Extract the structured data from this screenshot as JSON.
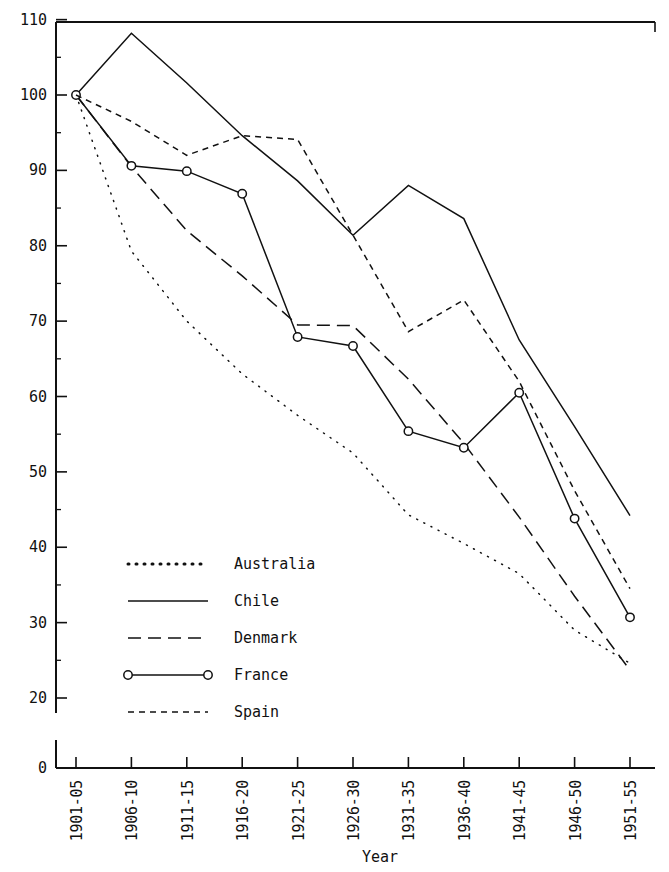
{
  "chart_data": {
    "type": "line",
    "title": "",
    "xlabel": "Year",
    "ylabel": "",
    "categories": [
      "1901-05",
      "1906-10",
      "1911-15",
      "1916-20",
      "1921-25",
      "1926-30",
      "1931-35",
      "1936-40",
      "1941-45",
      "1946-50",
      "1951-55"
    ],
    "ylim": [
      0,
      110
    ],
    "y_ticks": [
      0,
      20,
      30,
      40,
      50,
      60,
      70,
      80,
      90,
      100,
      110
    ],
    "y_axis_break_after": 0,
    "grid": false,
    "legend_position": "inside-lower-left",
    "series": [
      {
        "name": "Australia",
        "style": "dash-dot",
        "marker": "none",
        "values": [
          100.0,
          79.3,
          70.0,
          63.0,
          57.5,
          52.5,
          44.3,
          40.5,
          36.5,
          29.0,
          24.6
        ]
      },
      {
        "name": "Chile",
        "style": "solid",
        "marker": "none",
        "values": [
          100.0,
          108.2,
          101.6,
          94.6,
          88.6,
          81.4,
          88.0,
          83.6,
          67.5,
          56.0,
          44.2
        ]
      },
      {
        "name": "Denmark",
        "style": "long-dash",
        "marker": "none",
        "values": [
          100.0,
          90.5,
          82.0,
          76.0,
          69.5,
          69.4,
          62.3,
          53.8,
          44.0,
          33.5,
          23.7
        ]
      },
      {
        "name": "France",
        "style": "solid",
        "marker": "circle",
        "values": [
          100.0,
          90.6,
          89.9,
          86.9,
          67.9,
          66.7,
          55.4,
          53.2,
          60.5,
          43.8,
          30.7
        ]
      },
      {
        "name": "Spain",
        "style": "short-dash",
        "marker": "none",
        "values": [
          100.0,
          96.5,
          92.0,
          94.6,
          94.1,
          81.4,
          68.6,
          72.8,
          62.0,
          47.5,
          34.5
        ]
      }
    ]
  },
  "legend": {
    "items": [
      {
        "label": "Australia",
        "style": "dash-dot",
        "marker": "none"
      },
      {
        "label": "Chile",
        "style": "solid",
        "marker": "none"
      },
      {
        "label": "Denmark",
        "style": "long-dash",
        "marker": "none"
      },
      {
        "label": "France",
        "style": "solid",
        "marker": "circle"
      },
      {
        "label": "Spain",
        "style": "short-dash",
        "marker": "none"
      }
    ]
  },
  "axes": {
    "x_title": "Year"
  }
}
